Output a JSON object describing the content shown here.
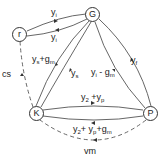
{
  "diagram": {
    "type": "flow-network",
    "nodes": [
      {
        "id": "G",
        "label": "G"
      },
      {
        "id": "r",
        "label": "r"
      },
      {
        "id": "K",
        "label": "K"
      },
      {
        "id": "P",
        "label": "P"
      }
    ],
    "edges": [
      {
        "from": "r",
        "to": "G",
        "label": "yi",
        "style": "solid"
      },
      {
        "from": "G",
        "to": "r",
        "label": "yi",
        "style": "solid"
      },
      {
        "from": "K",
        "to": "G",
        "label": "ys+gm",
        "style": "solid"
      },
      {
        "from": "G",
        "to": "K",
        "label": "ys",
        "style": "solid"
      },
      {
        "from": "P",
        "to": "G",
        "label": "yi-gm",
        "style": "solid"
      },
      {
        "from": "G",
        "to": "P",
        "label": "yf",
        "style": "solid"
      },
      {
        "from": "K",
        "to": "P",
        "label": "y2+yp",
        "style": "solid"
      },
      {
        "from": "P",
        "to": "K",
        "label": "y2+yp+gm",
        "style": "solid"
      },
      {
        "from": "K",
        "to": "r",
        "label": "cs",
        "style": "dashed"
      },
      {
        "from": "P",
        "to": "K",
        "label": "vm",
        "style": "dashed"
      }
    ]
  },
  "labels": {
    "rG_top": {
      "base": "y",
      "sub": "i"
    },
    "rG_bottom": {
      "base": "y",
      "sub": "i"
    },
    "KG_outer": {
      "base": "y",
      "sub": "s",
      "rest": "+g",
      "rest_sub": "m"
    },
    "KG_inner": {
      "base": "y",
      "sub": "s"
    },
    "PG_inner": {
      "base": "y",
      "sub": "i",
      "rest": " - g",
      "rest_sub": "m"
    },
    "PG_outer": {
      "base": "y",
      "sub": "f"
    },
    "KP_top": {
      "a": "y",
      "a_sub": "2",
      "b": " +y",
      "b_sub": "p"
    },
    "KP_bottom": {
      "a": "y",
      "a_sub": "2",
      "b": "+ y",
      "b_sub": "p",
      "c": "+g",
      "c_sub": "m"
    },
    "cs": "cs",
    "vm": "vm"
  }
}
